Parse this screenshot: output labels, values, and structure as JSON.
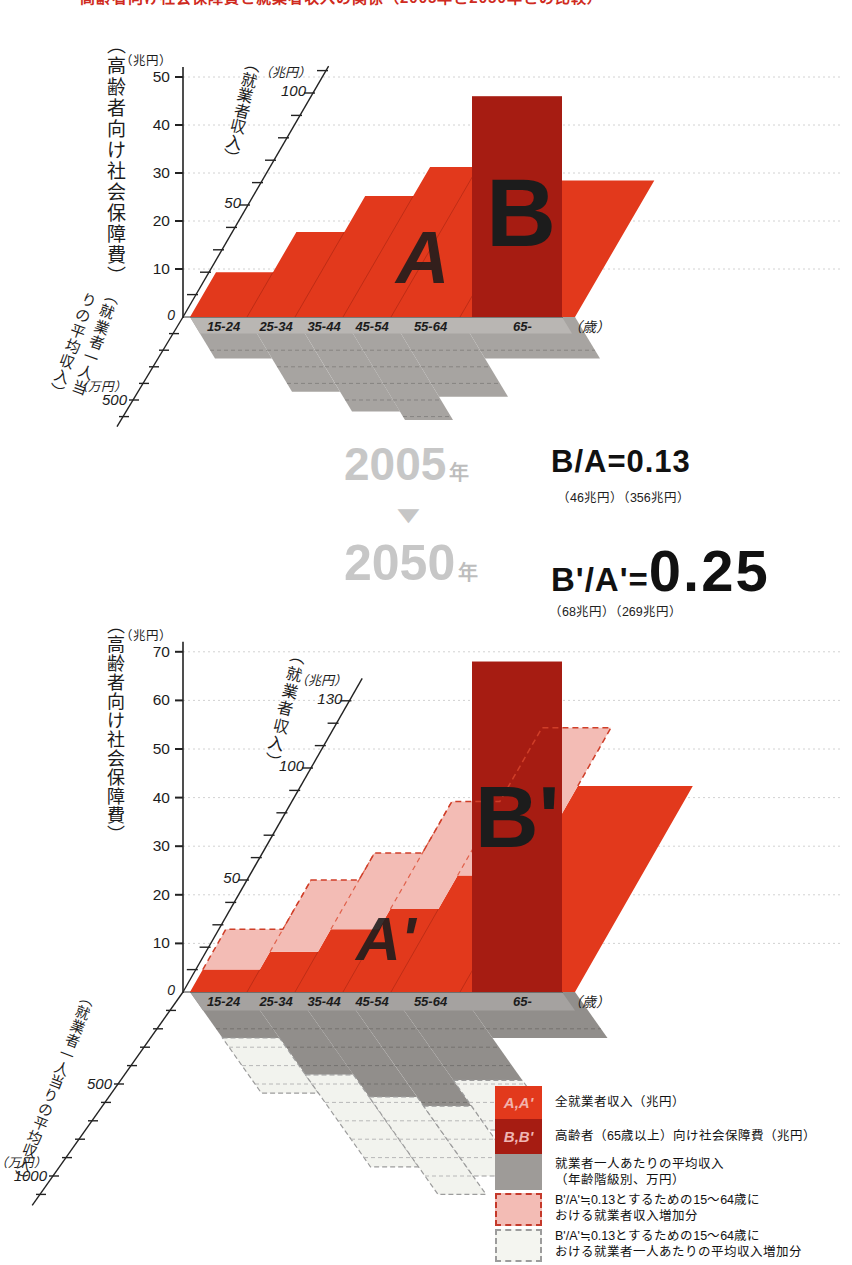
{
  "page": {
    "cropped_title": "高齢者向け社会保障費と就業者収入の関係（2005年と2050年との比較）"
  },
  "comparison": {
    "year1": "2005",
    "year2": "2050",
    "year_suffix": "年",
    "arrow": "▼",
    "ratio1": "B/A=0.13",
    "ratio1_values": "（46兆円）（356兆円）",
    "ratio2_lhs": "B'/A'=",
    "ratio2_value": "0.25",
    "ratio2_values": "（68兆円）（269兆円）"
  },
  "legend": {
    "items": [
      {
        "swatch": "red",
        "swatch_label": "A,A'",
        "lines": [
          "全就業者収入（兆円）",
          ""
        ]
      },
      {
        "swatch": "darkred",
        "swatch_label": "B,B'",
        "lines": [
          "高齢者（65歳以上）向け社会保障費（兆円）",
          ""
        ]
      },
      {
        "swatch": "gray",
        "swatch_label": "",
        "lines": [
          "就業者一人あたりの平均収入",
          "（年齢階級別、万円）"
        ]
      },
      {
        "swatch": "pink-dashed",
        "swatch_label": "",
        "lines": [
          "B'/A'≒0.13とするための15～64歳に",
          "おける就業者収入増加分"
        ]
      },
      {
        "swatch": "light-dashed",
        "swatch_label": "",
        "lines": [
          "B'/A'≒0.13とするための15～64歳に",
          "おける就業者一人あたりの平均収入増加分"
        ]
      }
    ]
  },
  "chart_data": [
    {
      "type": "area",
      "projection": "oblique-3d-step-surface",
      "year": "2005",
      "categories": [
        "15-24",
        "25-34",
        "35-44",
        "45-54",
        "55-64",
        "65-"
      ],
      "age_unit_label": "（歳）",
      "left_axis": {
        "title": "（高齢者向け社会保障費）",
        "unit": "（兆円）",
        "ticks": [
          10,
          20,
          30,
          40,
          50
        ],
        "origin_label": "0",
        "range": [
          0,
          50
        ]
      },
      "income_axis": {
        "title": "（就業者収入）",
        "unit": "（兆円）",
        "labeled_ticks": [
          50,
          100
        ],
        "range": [
          0,
          110
        ]
      },
      "avg_income_axis": {
        "title_columns": [
          "（就業者一人当",
          "りの平均収入）"
        ],
        "unit": "（万円）",
        "labeled_ticks": [
          500
        ],
        "range": [
          0,
          600
        ]
      },
      "series": {
        "worker_income": {
          "letter": "A",
          "total": "356兆円",
          "by_age_est_trillion": [
            20,
            38,
            54,
            67,
            76,
            61
          ]
        },
        "elderly_social_security": {
          "letter": "B",
          "value_trillion": 46
        },
        "avg_income_by_age_est_10k_yen": [
          250,
          450,
          570,
          620,
          480,
          250
        ]
      }
    },
    {
      "type": "area",
      "projection": "oblique-3d-step-surface",
      "year": "2050",
      "categories": [
        "15-24",
        "25-34",
        "35-44",
        "45-54",
        "55-64",
        "65-"
      ],
      "age_unit_label": "（歳）",
      "left_axis": {
        "title": "（高齢者向け社会保障費）",
        "unit": "（兆円）",
        "ticks": [
          10,
          20,
          30,
          40,
          50,
          60,
          70
        ],
        "origin_label": "0",
        "range": [
          0,
          70
        ]
      },
      "income_axis": {
        "title": "（就業者収入）",
        "unit": "（兆円）",
        "labeled_ticks": [
          50,
          100,
          130
        ],
        "range": [
          0,
          135
        ]
      },
      "avg_income_axis": {
        "title_columns": [
          "（就業者一人当りの平均収入）"
        ],
        "unit": "（万円）",
        "labeled_ticks": [
          500,
          1000
        ],
        "range": [
          0,
          1150
        ]
      },
      "series": {
        "worker_income": {
          "letter": "A'",
          "total": "269兆円",
          "by_age_est_trillion": [
            10,
            18,
            28,
            37,
            52,
            92
          ]
        },
        "elderly_social_security": {
          "letter": "B'",
          "value_trillion": 68
        },
        "avg_income_by_age_est_10k_yen": [
          250,
          450,
          570,
          620,
          480,
          250
        ],
        "income_increase_needed_est_trillion": [
          28,
          50,
          62,
          85,
          118
        ],
        "avg_income_increase_to_est_10k_yen": [
          550,
          950,
          1100,
          1000,
          750
        ]
      }
    }
  ]
}
